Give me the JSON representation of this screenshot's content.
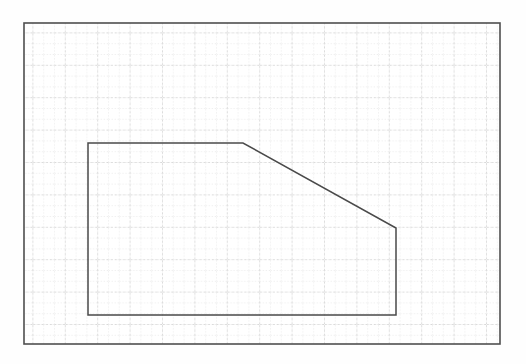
{
  "document": {
    "title": "Graph Paper Polygon Diagram",
    "media": "scanned-graph-paper",
    "background_color": "#fefefe"
  },
  "canvas": {
    "width": 526,
    "height": 364
  },
  "frame": {
    "name": "sheet-border",
    "x": 24,
    "y": 23,
    "width": 476,
    "height": 321,
    "stroke_color": "#4f4f4f",
    "stroke_width": 1.6,
    "fill_color": "#ffffff"
  },
  "grid": {
    "minor": {
      "spacing": 10.8,
      "color": "#cfcfcf",
      "stroke_width": 0.7,
      "dash": "1.2 1.8"
    },
    "major": {
      "spacing": 32.4,
      "color": "#b9b9b9",
      "stroke_width": 0.8,
      "dash": "2.2 2.0"
    },
    "visible": true
  },
  "chart_data": {
    "type": "polygon-outline",
    "xlabel": "",
    "ylabel": "",
    "grid": true,
    "legend": "none",
    "axis_ranges": {
      "x_px": [
        24,
        500
      ],
      "y_px": [
        23,
        344
      ]
    },
    "shapes": [
      {
        "name": "chamfered-rectangle",
        "closed": true,
        "stroke_color": "#4a4a4a",
        "stroke_width": 1.5,
        "fill": "none",
        "vertices_px": [
          [
            88,
            143
          ],
          [
            243,
            143
          ],
          [
            396,
            228
          ],
          [
            396,
            315
          ],
          [
            88,
            315
          ]
        ],
        "vertices_grid": [
          [
            6,
            11
          ],
          [
            20,
            11
          ],
          [
            34,
            19
          ],
          [
            34,
            27
          ],
          [
            6,
            27
          ]
        ],
        "edges": [
          {
            "name": "top-edge",
            "from": [
              88,
              143
            ],
            "to": [
              243,
              143
            ],
            "orientation": "horizontal",
            "length_px": 155
          },
          {
            "name": "chamfer-edge",
            "from": [
              243,
              143
            ],
            "to": [
              396,
              228
            ],
            "orientation": "diagonal",
            "length_px": 175
          },
          {
            "name": "right-edge",
            "from": [
              396,
              228
            ],
            "to": [
              396,
              315
            ],
            "orientation": "vertical",
            "length_px": 87
          },
          {
            "name": "bottom-edge",
            "from": [
              396,
              315
            ],
            "to": [
              88,
              315
            ],
            "orientation": "horizontal",
            "length_px": 308
          },
          {
            "name": "left-edge",
            "from": [
              88,
              315
            ],
            "to": [
              88,
              143
            ],
            "orientation": "vertical",
            "length_px": 172
          }
        ]
      }
    ]
  }
}
